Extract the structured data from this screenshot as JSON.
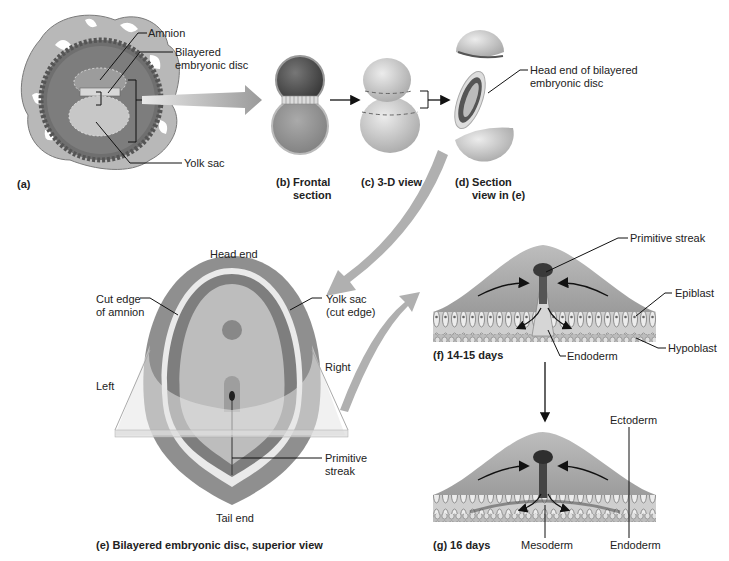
{
  "figure": {
    "panels": {
      "a": {
        "caption": "(a)",
        "labels": {
          "amnion": "Amnion",
          "bilayered_disc": "Bilayered\nembryonic disc",
          "bilayered_1": "Bilayered",
          "bilayered_2": "embryonic disc",
          "yolk_sac": "Yolk sac"
        }
      },
      "b": {
        "caption_1": "(b) Frontal",
        "caption_2": "section"
      },
      "c": {
        "caption": "(c) 3-D view"
      },
      "d": {
        "caption_1": "(d) Section",
        "caption_2": "view in (e)",
        "labels": {
          "head_end_1": "Head end of bilayered",
          "head_end_2": "embryonic disc"
        }
      },
      "e": {
        "caption": "(e) Bilayered embryonic disc, superior view",
        "labels": {
          "head_end": "Head end",
          "tail_end": "Tail end",
          "cut_edge_1": "Cut edge",
          "cut_edge_2": "of amnion",
          "yolk_sac_1": "Yolk sac",
          "yolk_sac_2": "(cut edge)",
          "left": "Left",
          "right": "Right",
          "primitive_streak_1": "Primitive",
          "primitive_streak_2": "streak"
        }
      },
      "f": {
        "caption": "(f) 14-15 days",
        "labels": {
          "primitive_streak": "Primitive streak",
          "epiblast": "Epiblast",
          "hypoblast": "Hypoblast",
          "endoderm": "Endoderm"
        }
      },
      "g": {
        "caption": "(g) 16 days",
        "labels": {
          "ectoderm": "Ectoderm",
          "mesoderm": "Mesoderm",
          "endoderm": "Endoderm"
        }
      }
    },
    "colors": {
      "dark_gray": "#555555",
      "mid_gray": "#8c8c8c",
      "light_gray": "#bdbdbd",
      "pale_gray": "#d9d9d9",
      "arrow_gray": "#a8a8a8",
      "line": "#222222"
    }
  }
}
